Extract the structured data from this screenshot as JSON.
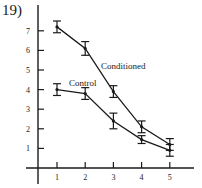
{
  "problem_number": "19)",
  "chart_data": {
    "type": "line",
    "title": "",
    "xlabel": "",
    "ylabel": "",
    "x": [
      1,
      2,
      3,
      4,
      5
    ],
    "xticks": [
      "1",
      "2",
      "3",
      "4",
      "5"
    ],
    "yticks": [
      "1",
      "2",
      "3",
      "4",
      "5",
      "6",
      "7"
    ],
    "ylim": [
      0,
      8
    ],
    "xlim": [
      0,
      6
    ],
    "grid": false,
    "legend": "inline labels",
    "series": [
      {
        "name": "Conditioned",
        "values": [
          7.2,
          6.1,
          3.9,
          2.1,
          1.2
        ],
        "error": [
          0.3,
          0.35,
          0.3,
          0.3,
          0.3
        ]
      },
      {
        "name": "Control",
        "values": [
          4.0,
          3.8,
          2.4,
          1.45,
          0.9
        ],
        "error": [
          0.3,
          0.3,
          0.4,
          0.2,
          0.3
        ]
      }
    ]
  }
}
